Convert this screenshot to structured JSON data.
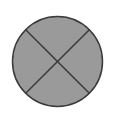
{
  "canvas": {
    "width": 114,
    "height": 120,
    "background_color": "#ffffff"
  },
  "figure": {
    "title": "circle divided into four sectors by two diagonal chords",
    "shape_label": "circle-with-x",
    "sector_count": 4,
    "fill_color": "#9a9a9a",
    "stroke_color": "#3a3a3a",
    "stroke_width": 1.5,
    "circle": {
      "center_x": 57.5,
      "center_y": 61.5,
      "radius": 45
    },
    "diagonals": [
      {
        "name": "diagonal-nw-se",
        "x1": 25.7,
        "y1": 29.7,
        "x2": 89.3,
        "y2": 93.3
      },
      {
        "name": "diagonal-ne-sw",
        "x1": 89.3,
        "y1": 29.7,
        "x2": 25.7,
        "y2": 93.3
      }
    ]
  },
  "chart_data": {
    "type": "pie",
    "title": "",
    "labels": [
      "",
      "",
      "",
      ""
    ],
    "values": [
      25,
      25,
      25,
      25
    ],
    "colors": [
      "#9a9a9a",
      "#9a9a9a",
      "#9a9a9a",
      "#9a9a9a"
    ],
    "legend": "none",
    "grid": false,
    "annotations": []
  }
}
